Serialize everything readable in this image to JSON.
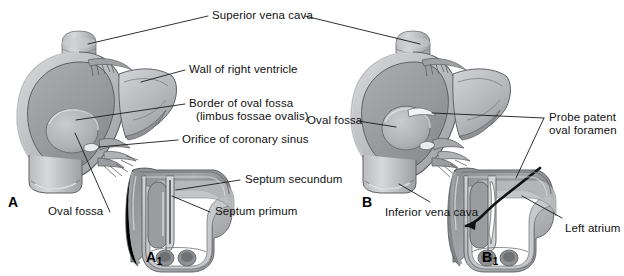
{
  "figure": {
    "title_alt": "Oval fossa and probe patent oval foramen",
    "background_color": "#ffffff",
    "line_color": "#1a1a1a",
    "tone_dark": "#8f9093",
    "tone_mid": "#a8aaad",
    "tone_light": "#c3c5c8",
    "tone_pale": "#d9dbdd",
    "tone_highlight": "#ebecee"
  },
  "panels": {
    "a": {
      "letter": "A",
      "sub": ""
    },
    "a1": {
      "letter": "A",
      "sub": "1"
    },
    "b": {
      "letter": "B",
      "sub": ""
    },
    "b1": {
      "letter": "B",
      "sub": "1"
    }
  },
  "labels": {
    "superior_vena_cava": "Superior vena cava",
    "wall_of_right_ventricle": "Wall of right ventricle",
    "border_of_oval_fossa_line1": "Border of oval fossa",
    "border_of_oval_fossa_line2": "(limbus fossae ovalis)",
    "orifice_of_coronary_sinus": "Orifice of coronary sinus",
    "oval_fossa_a": "Oval fossa",
    "septum_secundum": "Septum secundum",
    "septum_primum": "Septum primum",
    "oval_fossa_b": "Oval fossa",
    "probe_patent_line1": "Probe patent",
    "probe_patent_line2": "oval foramen",
    "inferior_vena_cava": "Inferior vena cava",
    "left_atrium": "Left atrium"
  }
}
